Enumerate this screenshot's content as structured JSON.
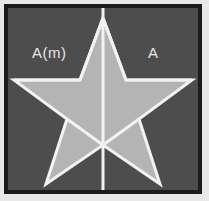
{
  "figure": {
    "background_color": "#4d4d4d",
    "frame_color": "#1c1c1c",
    "outer_color": "#e8e8e8",
    "star_fill_color": "#b4b4b4",
    "stroke_color": "#f2f2f2",
    "label_color": "#e6e6e6"
  },
  "labels": {
    "left": "A(m)",
    "right": "A"
  },
  "icons": {
    "mirror_axis": "vertical-mirror-line-icon",
    "star": "five-point-star-icon"
  },
  "geometry": {
    "viewbox": "0 0 190 182",
    "star_outer_points": [
      [
        95,
        10
      ],
      [
        118,
        72
      ],
      [
        184,
        72
      ],
      [
        131,
        111
      ],
      [
        152,
        176
      ],
      [
        95,
        137
      ],
      [
        38,
        176
      ],
      [
        59,
        111
      ],
      [
        6,
        72
      ],
      [
        72,
        72
      ]
    ],
    "mirror_axis_line": [
      [
        95,
        0
      ],
      [
        95,
        182
      ]
    ],
    "left_arm_chord": [
      [
        6,
        72
      ],
      [
        72,
        72
      ]
    ],
    "right_arm_chord": [
      [
        118,
        72
      ],
      [
        184,
        72
      ]
    ],
    "left_inner_stroke": [
      [
        72,
        72
      ],
      [
        95,
        10
      ]
    ],
    "right_inner_stroke": [
      [
        118,
        72
      ],
      [
        95,
        10
      ]
    ],
    "bottom_left_stroke": [
      [
        59,
        111
      ],
      [
        95,
        137
      ]
    ],
    "bottom_right_stroke": [
      [
        131,
        111
      ],
      [
        95,
        137
      ]
    ]
  }
}
